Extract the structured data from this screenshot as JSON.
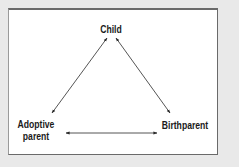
{
  "diagram": {
    "type": "triangle-relationship",
    "nodes": [
      {
        "id": "child",
        "label": "Child"
      },
      {
        "id": "adoptive",
        "label_line1": "Adoptive",
        "label_line2": "parent"
      },
      {
        "id": "birth",
        "label": "Birthparent"
      }
    ],
    "edges": [
      {
        "from": "child",
        "to": "adoptive",
        "bidirectional": true
      },
      {
        "from": "child",
        "to": "birth",
        "bidirectional": true
      },
      {
        "from": "adoptive",
        "to": "birth",
        "bidirectional": true
      }
    ]
  },
  "colors": {
    "background": "#e9e9e9",
    "panel": "#ffffff",
    "stroke": "#2a2a2a",
    "text": "#1a1a1a"
  }
}
